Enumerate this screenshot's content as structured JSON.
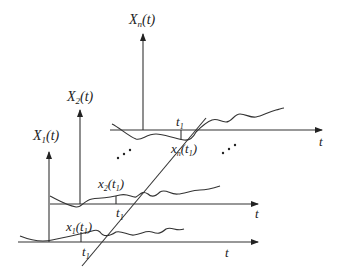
{
  "diagram": {
    "axes": [
      {
        "id": "x1",
        "y_label_main": "X",
        "y_label_sub": "1",
        "y_label_tail": "(t)",
        "x_label": "t",
        "t1_label_main": "t",
        "t1_label_sub": "1",
        "sample_label_main": "x",
        "sample_label_sub": "1",
        "sample_label_tail_open": "(t",
        "sample_label_tail_sub": "1",
        "sample_label_close": ")"
      },
      {
        "id": "x2",
        "y_label_main": "X",
        "y_label_sub": "2",
        "y_label_tail": "(t)",
        "x_label": "t",
        "t1_label_main": "t",
        "t1_label_sub": "1",
        "sample_label_main": "x",
        "sample_label_sub": "2",
        "sample_label_tail_open": "(t",
        "sample_label_tail_sub": "1",
        "sample_label_close": ")"
      },
      {
        "id": "xn",
        "y_label_main": "X",
        "y_label_sub": "n",
        "y_label_tail": "(t)",
        "x_label": "t",
        "t1_label_main": "t",
        "t1_label_sub": "1",
        "sample_label_main": "x",
        "sample_label_sub": "n",
        "sample_label_tail_open": "(t",
        "sample_label_tail_sub": "1",
        "sample_label_close": ")"
      }
    ],
    "ellipsis": ". . ."
  }
}
